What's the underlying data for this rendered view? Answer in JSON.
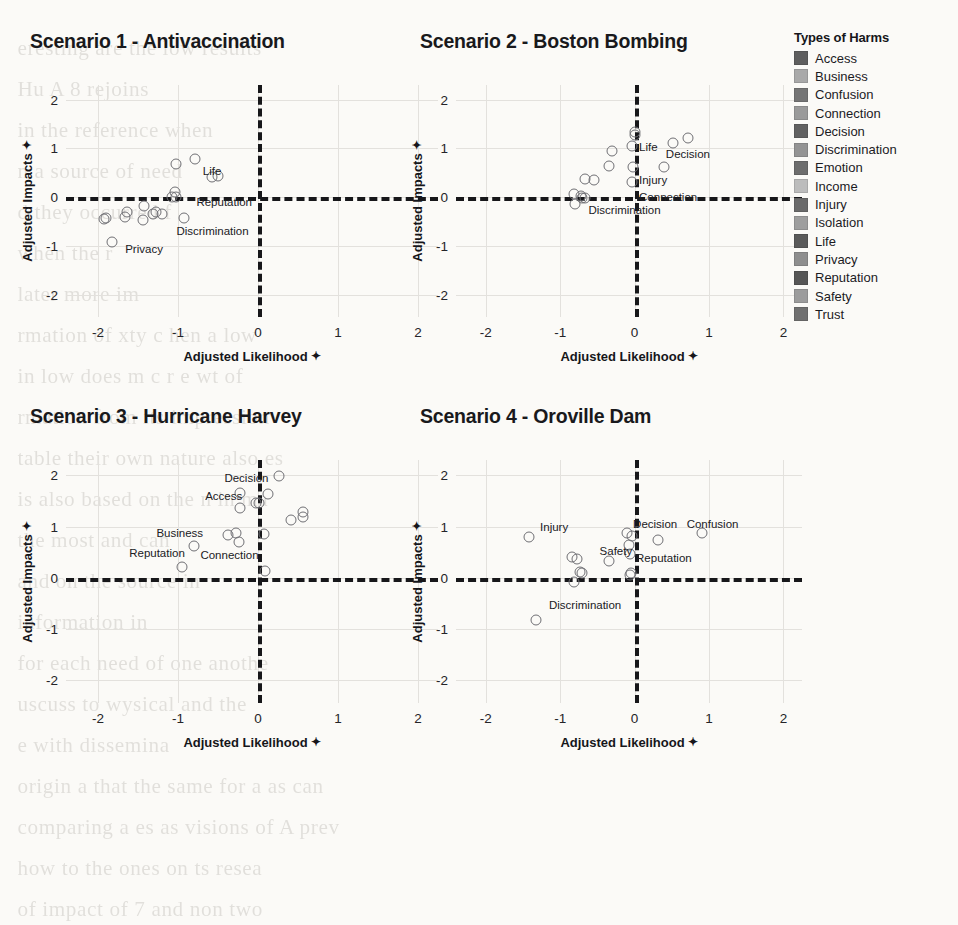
{
  "legend": {
    "title": "Types of Harms",
    "items": [
      {
        "label": "Access",
        "color": "#5e5e5e"
      },
      {
        "label": "Business",
        "color": "#a9a9a9"
      },
      {
        "label": "Confusion",
        "color": "#757575"
      },
      {
        "label": "Connection",
        "color": "#9a9a9a"
      },
      {
        "label": "Decision",
        "color": "#616161"
      },
      {
        "label": "Discrimination",
        "color": "#949494"
      },
      {
        "label": "Emotion",
        "color": "#6d6d6d"
      },
      {
        "label": "Income",
        "color": "#bcbcbc"
      },
      {
        "label": "Injury",
        "color": "#6a6a6a"
      },
      {
        "label": "Isolation",
        "color": "#9e9e9e"
      },
      {
        "label": "Life",
        "color": "#5a5a5a"
      },
      {
        "label": "Privacy",
        "color": "#8e8e8e"
      },
      {
        "label": "Reputation",
        "color": "#565656"
      },
      {
        "label": "Safety",
        "color": "#9c9c9c"
      },
      {
        "label": "Trust",
        "color": "#707070"
      }
    ]
  },
  "axes": {
    "x_label": "Adjusted Likelihood",
    "y_label": "Adjusted Impacts",
    "sort_glyph": "✦",
    "xticks": [
      "-2",
      "-1",
      "0",
      "1",
      "2"
    ],
    "yticks": [
      "2",
      "1",
      "0",
      "-1",
      "-2"
    ],
    "xlim": [
      -2.4,
      2.25
    ],
    "ylim": [
      -2.45,
      2.3
    ]
  },
  "chart_data": [
    {
      "type": "scatter",
      "title": "Scenario 1 - Antivaccination",
      "xlabel": "Adjusted Likelihood",
      "ylabel": "Adjusted Impacts",
      "xlim": [
        -2.4,
        2.25
      ],
      "ylim": [
        -2.45,
        2.3
      ],
      "grid": true,
      "points": [
        {
          "x": -1.02,
          "y": 0.68
        },
        {
          "x": -0.79,
          "y": 0.79
        },
        {
          "x": -0.58,
          "y": 0.42
        },
        {
          "x": -0.5,
          "y": 0.43
        },
        {
          "x": -1.04,
          "y": 0.1
        },
        {
          "x": -1.08,
          "y": 0.0
        },
        {
          "x": -1.03,
          "y": 0.01
        },
        {
          "x": -1.42,
          "y": -0.18
        },
        {
          "x": -1.64,
          "y": -0.3
        },
        {
          "x": -1.66,
          "y": -0.4
        },
        {
          "x": -1.27,
          "y": -0.31
        },
        {
          "x": -1.31,
          "y": -0.35
        },
        {
          "x": -1.2,
          "y": -0.34
        },
        {
          "x": -1.44,
          "y": -0.47
        },
        {
          "x": -1.9,
          "y": -0.43
        },
        {
          "x": -1.92,
          "y": -0.44
        },
        {
          "x": -0.92,
          "y": -0.42
        },
        {
          "x": -1.82,
          "y": -0.92
        }
      ],
      "annotations": [
        {
          "text": "Life",
          "x": -0.69,
          "y": 0.52
        },
        {
          "text": "Reputation",
          "x": -0.77,
          "y": -0.11
        },
        {
          "text": "Discrimination",
          "x": -1.02,
          "y": -0.7
        },
        {
          "text": "Privacy",
          "x": -1.66,
          "y": -1.08
        }
      ]
    },
    {
      "type": "scatter",
      "title": "Scenario 2 - Boston Bombing",
      "xlabel": "Adjusted Likelihood",
      "ylabel": "Adjusted Impacts",
      "xlim": [
        -2.4,
        2.25
      ],
      "ylim": [
        -2.45,
        2.3
      ],
      "grid": true,
      "points": [
        {
          "x": 0.0,
          "y": 1.34
        },
        {
          "x": 0.0,
          "y": 1.28
        },
        {
          "x": -0.04,
          "y": 1.06
        },
        {
          "x": -0.3,
          "y": 0.94
        },
        {
          "x": 0.52,
          "y": 1.12
        },
        {
          "x": 0.72,
          "y": 1.22
        },
        {
          "x": -0.35,
          "y": 0.64
        },
        {
          "x": -0.02,
          "y": 0.62
        },
        {
          "x": 0.4,
          "y": 0.62
        },
        {
          "x": -0.66,
          "y": 0.38
        },
        {
          "x": -0.54,
          "y": 0.36
        },
        {
          "x": -0.03,
          "y": 0.32
        },
        {
          "x": -0.81,
          "y": 0.07
        },
        {
          "x": -0.72,
          "y": 0.02
        },
        {
          "x": -0.7,
          "y": -0.02
        },
        {
          "x": -0.66,
          "y": -0.02
        },
        {
          "x": -0.8,
          "y": -0.13
        }
      ],
      "annotations": [
        {
          "text": "Life",
          "x": 0.06,
          "y": 1.01
        },
        {
          "text": "Decision",
          "x": 0.42,
          "y": 0.86
        },
        {
          "text": "Injury",
          "x": 0.06,
          "y": 0.33
        },
        {
          "text": "Connection",
          "x": 0.06,
          "y": -0.01
        },
        {
          "text": "Discrimination",
          "x": -0.62,
          "y": -0.28
        }
      ]
    },
    {
      "type": "scatter",
      "title": "Scenario 3 - Hurricane Harvey",
      "xlabel": "Adjusted Likelihood",
      "ylabel": "Adjusted Impacts",
      "xlim": [
        -2.4,
        2.25
      ],
      "ylim": [
        -2.45,
        2.3
      ],
      "grid": true,
      "points": [
        {
          "x": 0.26,
          "y": 1.99
        },
        {
          "x": -0.23,
          "y": 1.65
        },
        {
          "x": 0.12,
          "y": 1.64
        },
        {
          "x": -0.02,
          "y": 1.45
        },
        {
          "x": 0.01,
          "y": 1.45
        },
        {
          "x": -0.22,
          "y": 1.37
        },
        {
          "x": 0.56,
          "y": 1.29
        },
        {
          "x": 0.56,
          "y": 1.19
        },
        {
          "x": 0.41,
          "y": 1.13
        },
        {
          "x": -0.27,
          "y": 0.88
        },
        {
          "x": -0.38,
          "y": 0.83
        },
        {
          "x": 0.08,
          "y": 0.86
        },
        {
          "x": -0.24,
          "y": 0.7
        },
        {
          "x": -0.8,
          "y": 0.61
        },
        {
          "x": -0.95,
          "y": 0.21
        },
        {
          "x": 0.09,
          "y": 0.13
        }
      ],
      "annotations": [
        {
          "text": "Decision",
          "x": -0.42,
          "y": 1.92
        },
        {
          "text": "Access",
          "x": -0.66,
          "y": 1.58
        },
        {
          "text": "Business",
          "x": -1.27,
          "y": 0.85
        },
        {
          "text": "Reputation",
          "x": -1.61,
          "y": 0.47
        },
        {
          "text": "Connection",
          "x": -0.72,
          "y": 0.43
        }
      ]
    },
    {
      "type": "scatter",
      "title": "Scenario 4 - Oroville Dam",
      "xlabel": "Adjusted Likelihood",
      "ylabel": "Adjusted Impacts",
      "xlim": [
        -2.4,
        2.25
      ],
      "ylim": [
        -2.45,
        2.3
      ],
      "grid": true,
      "points": [
        {
          "x": -1.42,
          "y": 0.8
        },
        {
          "x": -0.1,
          "y": 0.88
        },
        {
          "x": -0.04,
          "y": 0.82
        },
        {
          "x": 0.9,
          "y": 0.87
        },
        {
          "x": 0.32,
          "y": 0.73
        },
        {
          "x": -0.08,
          "y": 0.64
        },
        {
          "x": -0.06,
          "y": 0.47
        },
        {
          "x": -0.84,
          "y": 0.4
        },
        {
          "x": -0.78,
          "y": 0.36
        },
        {
          "x": -0.35,
          "y": 0.33
        },
        {
          "x": -0.74,
          "y": 0.12
        },
        {
          "x": -0.71,
          "y": 0.09
        },
        {
          "x": -0.05,
          "y": 0.1
        },
        {
          "x": -0.06,
          "y": 0.05
        },
        {
          "x": -0.82,
          "y": -0.08
        },
        {
          "x": -1.32,
          "y": -0.83
        }
      ],
      "annotations": [
        {
          "text": "Injury",
          "x": -1.27,
          "y": 0.97
        },
        {
          "text": "Decision",
          "x": -0.02,
          "y": 1.02
        },
        {
          "text": "Confusion",
          "x": 0.7,
          "y": 1.03
        },
        {
          "text": "Safety",
          "x": -0.47,
          "y": 0.51
        },
        {
          "text": "Reputation",
          "x": 0.02,
          "y": 0.36
        },
        {
          "text": "Discrimination",
          "x": -1.15,
          "y": -0.55
        }
      ]
    }
  ],
  "bleed_text": [
    "",
    "",
    "",
    "eresting are the low results",
    "Hu        A        8 rejoins",
    "",
    "in    the   reference     when",
    "n    a   source   of   need",
    "d    they  occurred      f",
    "when             the    r",
    "later        more  im",
    "rmation  of  xty  c      hen    a      low",
    "in  low   does  m     c  r     e      wt   of",
    "rmation  from  its  impression",
    "",
    "",
    "",
    "table    their   own    nature  also  es",
    "is  also   based   on  the  n   in   ma",
    "the  most    and      can",
    "and  on  the   source    in",
    "information     in",
    "for  each  need  of  one  anothe",
    "uscuss  to  wysical  and  the",
    "e  with  dissemina",
    "",
    "origin  a  that  the  same  for  a  as  can",
    "comparing  a  es  as  visions  of     A    prev",
    "how  to  the  ones  on   ts   resea",
    "of  impact  of  7     and  non  two"
  ]
}
